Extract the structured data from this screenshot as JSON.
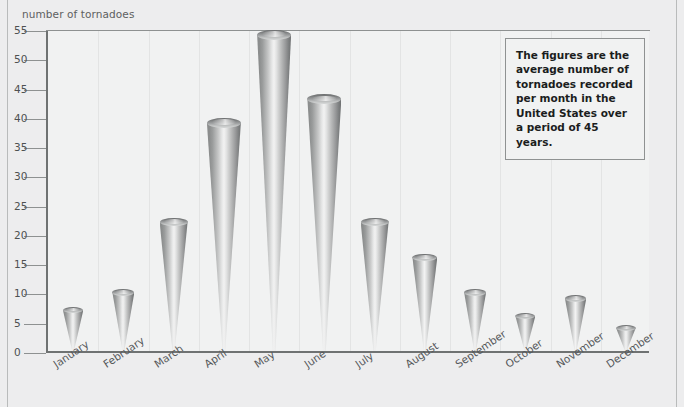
{
  "chart_data": {
    "type": "bar",
    "title": "",
    "xlabel": "",
    "ylabel": "number of tornadoes",
    "ylim": [
      0,
      55
    ],
    "yticks": [
      0,
      5,
      10,
      15,
      20,
      25,
      30,
      35,
      40,
      45,
      50,
      55
    ],
    "grid": false,
    "legend": null,
    "categories": [
      "January",
      "February",
      "March",
      "April",
      "May",
      "June",
      "July",
      "August",
      "September",
      "October",
      "November",
      "December"
    ],
    "values": [
      7,
      10,
      22,
      39,
      54,
      43,
      22,
      16,
      10,
      6,
      9,
      4
    ],
    "annotations": [
      "The figures are the average number of tornadoes recorded per month in the United States over a period of 45 years."
    ],
    "marker_style": "cone",
    "colors": {
      "background": "#ededee",
      "plot_background": "#f1f2f2",
      "axis": "#6f7272",
      "cone_dark": "#6f7172",
      "cone_light": "#f2f2f2",
      "text": "#4e5151",
      "note_border": "#8f9292"
    }
  },
  "axis": {
    "y_title": "number of tornadoes"
  },
  "note": {
    "text": "The figures are the average number of tornadoes recorded per month in the United States over a period of 45 years."
  }
}
